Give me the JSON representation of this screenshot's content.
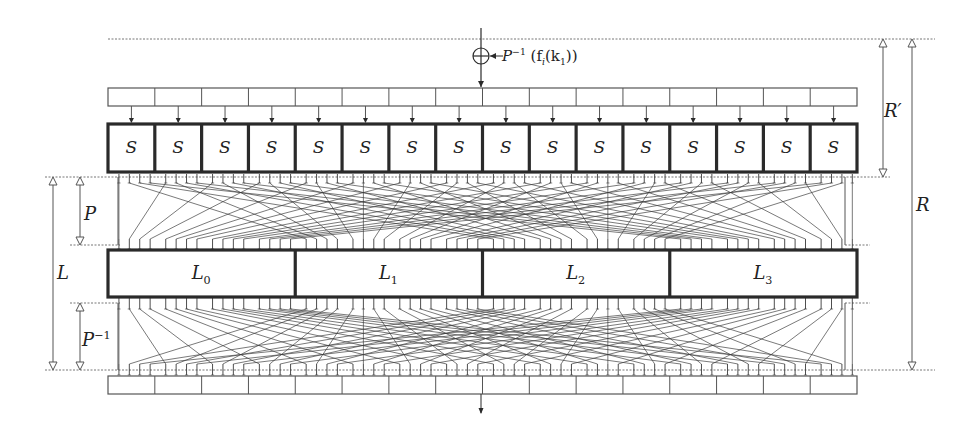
{
  "diagram": {
    "type": "spn-round-structure",
    "key_addition": {
      "symbol": "xor-circle",
      "label_main": "P",
      "label_sup": "−1",
      "label_args": "(f",
      "label_sub_i": "i",
      "label_args2": "(k",
      "label_sub_1": "1",
      "label_close": "))"
    },
    "state_bar_top": {
      "cells": 16
    },
    "sbox_layer": {
      "count": 16,
      "labels": [
        "S",
        "S",
        "S",
        "S",
        "S",
        "S",
        "S",
        "S",
        "S",
        "S",
        "S",
        "S",
        "S",
        "S",
        "S",
        "S"
      ]
    },
    "permutation_layer": {
      "label": "P"
    },
    "linear_layer": {
      "count": 4,
      "labels": [
        {
          "main": "L",
          "sub": "0"
        },
        {
          "main": "L",
          "sub": "1"
        },
        {
          "main": "L",
          "sub": "2"
        },
        {
          "main": "L",
          "sub": "3"
        }
      ]
    },
    "inverse_permutation_layer": {
      "label_main": "P",
      "label_sup": "−1"
    },
    "state_bar_bottom": {
      "cells": 16
    },
    "dimensions": {
      "L_span": "L",
      "P_span": "P",
      "P_inv_span_main": "P",
      "P_inv_span_sup": "−1",
      "R_prime_span": "R′",
      "R_span": "R"
    },
    "colors": {
      "stroke": "#2a2a2a",
      "thin": "#555555",
      "dotted": "#777777",
      "wire": "#3a3a3a"
    }
  }
}
